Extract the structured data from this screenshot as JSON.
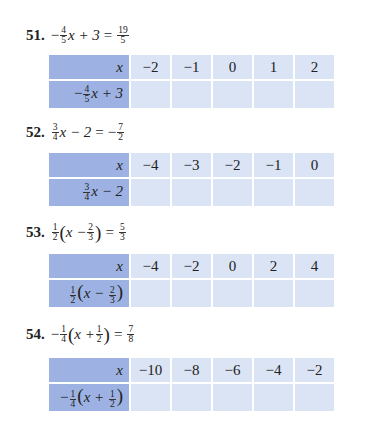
{
  "problems": [
    {
      "number": "51.",
      "equation": {
        "lhs_sign": "−",
        "lhs_frac": [
          "4",
          "5"
        ],
        "lhs_rest": "x + 3",
        "eq": "=",
        "rhs_sign": "",
        "rhs_frac": [
          "19",
          "5"
        ]
      },
      "table": {
        "header_label": "x",
        "x_values": [
          "−2",
          "−1",
          "0",
          "1",
          "2"
        ],
        "row_label": {
          "sign": "−",
          "frac": [
            "4",
            "5"
          ],
          "rest": "x + 3"
        },
        "row_values": [
          "",
          "",
          "",
          "",
          ""
        ]
      }
    },
    {
      "number": "52.",
      "equation": {
        "lhs_sign": "",
        "lhs_frac": [
          "3",
          "4"
        ],
        "lhs_rest": "x − 2",
        "eq": "=",
        "rhs_sign": "−",
        "rhs_frac": [
          "7",
          "2"
        ]
      },
      "table": {
        "header_label": "x",
        "x_values": [
          "−4",
          "−3",
          "−2",
          "−1",
          "0"
        ],
        "row_label": {
          "sign": "",
          "frac": [
            "3",
            "4"
          ],
          "rest": "x − 2"
        },
        "row_values": [
          "",
          "",
          "",
          "",
          ""
        ]
      }
    },
    {
      "number": "53.",
      "equation": {
        "coef_frac": [
          "1",
          "2"
        ],
        "inner": "x −",
        "inner_frac": [
          "2",
          "3"
        ],
        "eq": "=",
        "rhs_frac": [
          "5",
          "3"
        ]
      },
      "table": {
        "header_label": "x",
        "x_values": [
          "−4",
          "−2",
          "0",
          "2",
          "4"
        ],
        "row_label": {
          "coef_frac": [
            "1",
            "2"
          ],
          "inner": "x −",
          "inner_frac": [
            "2",
            "3"
          ]
        },
        "row_values": [
          "",
          "",
          "",
          "",
          ""
        ]
      }
    },
    {
      "number": "54.",
      "equation": {
        "sign": "−",
        "coef_frac": [
          "1",
          "4"
        ],
        "inner": "x +",
        "inner_frac": [
          "1",
          "2"
        ],
        "eq": "=",
        "rhs_frac": [
          "7",
          "8"
        ]
      },
      "table": {
        "header_label": "x",
        "x_values": [
          "−10",
          "−8",
          "−6",
          "−4",
          "−2"
        ],
        "row_label": {
          "sign": "−",
          "coef_frac": [
            "1",
            "4"
          ],
          "inner": "x +",
          "inner_frac": [
            "1",
            "2"
          ]
        },
        "row_values": [
          "",
          "",
          "",
          "",
          ""
        ]
      }
    }
  ],
  "colors": {
    "header_fill": "#9db2e2",
    "cell_fill": "#dbe4f5"
  }
}
